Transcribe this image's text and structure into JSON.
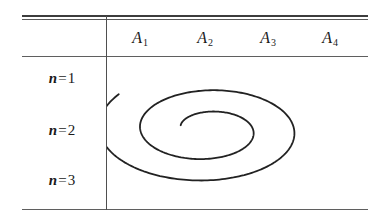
{
  "figure": {
    "type": "table-with-spiral-overlay",
    "background_color": "#ffffff",
    "rule_color": "#4f4f4f",
    "text_color": "#1a1a1a"
  },
  "table": {
    "column_headers": [
      {
        "base": "A",
        "subscript": "1"
      },
      {
        "base": "A",
        "subscript": "2"
      },
      {
        "base": "A",
        "subscript": "3"
      },
      {
        "base": "A",
        "subscript": "4"
      }
    ],
    "row_labels": [
      {
        "var": "n",
        "eq": "=",
        "num": "1"
      },
      {
        "var": "n",
        "eq": "=",
        "num": "2"
      },
      {
        "var": "n",
        "eq": "=",
        "num": "3"
      }
    ]
  },
  "chart_data": {
    "type": "line",
    "title": "",
    "xlabel": "",
    "ylabel": "",
    "annotations": [
      "elliptical spiral drawn across the table body cells"
    ],
    "grid": false,
    "legend": null,
    "series": [
      {
        "name": "spiral",
        "description": "Archimedean-style elliptical spiral, about two turns, unwinding counter-clockwise outward from an inner open end to an outer open end at lower-left",
        "stroke_color": "#222222",
        "stroke_width": 1.8,
        "center": [
          100,
          73
        ],
        "turns": 2.05,
        "theta_start_deg": 20,
        "theta_end_deg": 758,
        "rx_start": 28,
        "rx_end": 112,
        "ry_start": 14,
        "ry_end": 58,
        "open_end_inner": [
          93,
          76
        ],
        "open_end_outer": [
          36,
          91
        ]
      }
    ]
  }
}
